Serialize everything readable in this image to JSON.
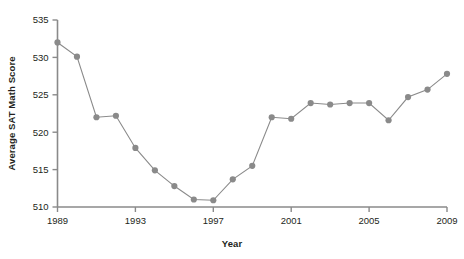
{
  "chart_data": {
    "type": "line",
    "title": "",
    "xlabel": "Year",
    "ylabel": "Average SAT Math Score",
    "xlim": [
      1989,
      2009
    ],
    "ylim": [
      510,
      535
    ],
    "xticks": [
      1989,
      1993,
      1997,
      2001,
      2005,
      2009
    ],
    "yticks": [
      510,
      515,
      520,
      525,
      530,
      535
    ],
    "grid": false,
    "legend": null,
    "marker": "circle",
    "series_color": "#8a8a8a",
    "axis_color": "#8a8a8a",
    "text_color": "#231f20",
    "x": [
      1989,
      1990,
      1991,
      1992,
      1993,
      1994,
      1995,
      1996,
      1997,
      1998,
      1999,
      2000,
      2001,
      2002,
      2003,
      2004,
      2005,
      2006,
      2007,
      2008,
      2009
    ],
    "values": [
      532.0,
      530.1,
      522.0,
      522.2,
      517.9,
      514.9,
      512.8,
      511.0,
      510.9,
      513.7,
      515.5,
      522.0,
      521.8,
      523.9,
      523.7,
      523.9,
      523.9,
      521.6,
      524.7,
      525.7,
      527.8
    ],
    "series": [
      {
        "name": "Average SAT Math Score",
        "values": [
          532.0,
          530.1,
          522.0,
          522.2,
          517.9,
          514.9,
          512.8,
          511.0,
          510.9,
          513.7,
          515.5,
          522.0,
          521.8,
          523.9,
          523.7,
          523.9,
          523.9,
          521.6,
          524.7,
          525.7,
          527.8
        ]
      }
    ]
  },
  "axes": {
    "y_title": "Average SAT Math Score",
    "x_title": "Year"
  }
}
